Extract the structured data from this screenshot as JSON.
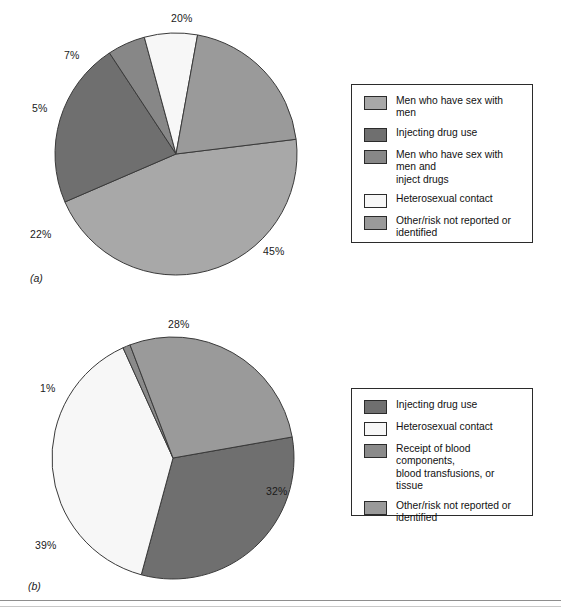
{
  "figure": {
    "width": 561,
    "height": 612,
    "background": "#ffffff",
    "rule_color": "#8e8e8e"
  },
  "palette": {
    "men_sex_with_men": "#a8a8a8",
    "injecting_drug_use": "#6f6f6f",
    "msm_and_inject": "#878787",
    "heterosexual_contact": "#f7f7f7",
    "other_risk": "#9a9a9a",
    "blood_components": "#8a8a8a",
    "outline": "#3a3a3a"
  },
  "panels": [
    {
      "letter": "(a)",
      "center_x": 176,
      "center_y": 154,
      "radius": 121,
      "start_angle_deg": -7,
      "legend": {
        "x": 351,
        "y": 84,
        "width": 182,
        "height": 159,
        "items": [
          {
            "label_lines": [
              "Men who have sex with men"
            ],
            "color_key": "men_sex_with_men"
          },
          {
            "label_lines": [
              "Injecting drug use"
            ],
            "color_key": "injecting_drug_use"
          },
          {
            "label_lines": [
              "Men who have sex with men and",
              "inject drugs"
            ],
            "color_key": "msm_and_inject"
          },
          {
            "label_lines": [
              "Heterosexual contact"
            ],
            "color_key": "heterosexual_contact"
          },
          {
            "label_lines": [
              "Other/risk not reported or",
              "identified"
            ],
            "color_key": "other_risk"
          }
        ]
      },
      "labels": [
        {
          "text": "20%",
          "x": 171,
          "y": 12
        },
        {
          "text": "7%",
          "x": 64,
          "y": 49
        },
        {
          "text": "5%",
          "x": 32,
          "y": 102
        },
        {
          "text": "22%",
          "x": 30,
          "y": 228
        },
        {
          "text": "45%",
          "x": 263,
          "y": 245
        }
      ]
    },
    {
      "letter": "(b)",
      "center_x": 173,
      "center_y": 458,
      "radius": 121,
      "start_angle_deg": -10,
      "legend": {
        "x": 351,
        "y": 388,
        "width": 182,
        "height": 128,
        "items": [
          {
            "label_lines": [
              "Injecting drug use"
            ],
            "color_key": "injecting_drug_use"
          },
          {
            "label_lines": [
              "Heterosexual contact"
            ],
            "color_key": "heterosexual_contact"
          },
          {
            "label_lines": [
              "Receipt of blood components,",
              "blood transfusions, or tissue"
            ],
            "color_key": "blood_components"
          },
          {
            "label_lines": [
              "Other/risk not reported or",
              "identified"
            ],
            "color_key": "other_risk"
          }
        ]
      },
      "labels": [
        {
          "text": "28%",
          "x": 168,
          "y": 318
        },
        {
          "text": "1%",
          "x": 40,
          "y": 382
        },
        {
          "text": "39%",
          "x": 35,
          "y": 539
        },
        {
          "text": "32%",
          "x": 266,
          "y": 485
        }
      ]
    }
  ],
  "chart_data": [
    {
      "type": "pie",
      "title": "(a)",
      "categories": [
        "Men who have sex with men",
        "Injecting drug use",
        "Men who have sex with men and inject drugs",
        "Heterosexual contact",
        "Other/risk not reported or identified"
      ],
      "values": [
        45,
        22,
        5,
        7,
        20
      ],
      "data_labels": [
        "45%",
        "22%",
        "5%",
        "7%",
        "20%"
      ],
      "units": "percent",
      "colors": [
        "#a8a8a8",
        "#6f6f6f",
        "#878787",
        "#f7f7f7",
        "#9a9a9a"
      ],
      "legend_position": "right",
      "grid": false
    },
    {
      "type": "pie",
      "title": "(b)",
      "categories": [
        "Injecting drug use",
        "Heterosexual contact",
        "Receipt of blood components, blood transfusions, or tissue",
        "Other/risk not reported or identified"
      ],
      "values": [
        32,
        39,
        1,
        28
      ],
      "data_labels": [
        "32%",
        "39%",
        "1%",
        "28%"
      ],
      "units": "percent",
      "colors": [
        "#6f6f6f",
        "#f7f7f7",
        "#8a8a8a",
        "#9a9a9a"
      ],
      "legend_position": "right",
      "grid": false
    }
  ]
}
